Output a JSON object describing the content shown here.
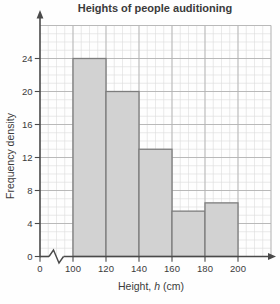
{
  "title": "Heights of people auditioning",
  "y_axis": {
    "label": "Frequency density",
    "ticks": [
      0,
      4,
      8,
      12,
      16,
      20,
      24
    ],
    "max": 28
  },
  "x_axis": {
    "label_prefix": "Height, ",
    "label_var": "h",
    "label_suffix": " (cm)",
    "label_full": "Height, h (cm)",
    "ticks": [
      0,
      100,
      120,
      140,
      160,
      180,
      200
    ],
    "has_break_between_0_and_100": true
  },
  "chart_data": {
    "type": "bar",
    "subtype": "histogram",
    "title": "Heights of people auditioning",
    "xlabel": "Height, h (cm)",
    "ylabel": "Frequency density",
    "categories": [
      "100-120",
      "120-140",
      "140-160",
      "160-180",
      "180-200"
    ],
    "values": [
      24,
      20,
      13,
      5.5,
      6.5
    ],
    "bins": [
      {
        "from": 100,
        "to": 120,
        "frequency_density": 24
      },
      {
        "from": 120,
        "to": 140,
        "frequency_density": 20
      },
      {
        "from": 140,
        "to": 160,
        "frequency_density": 13
      },
      {
        "from": 160,
        "to": 180,
        "frequency_density": 5.5
      },
      {
        "from": 180,
        "to": 200,
        "frequency_density": 6.5
      }
    ],
    "ylim": [
      0,
      28
    ],
    "x_tick_labels": [
      "0",
      "100",
      "120",
      "140",
      "160",
      "180",
      "200"
    ],
    "y_tick_labels": [
      "0",
      "4",
      "8",
      "12",
      "16",
      "20",
      "24"
    ],
    "grid": true,
    "x_axis_break": true,
    "legend": "none",
    "colors": {
      "bar_fill": "#d2d2d2",
      "bar_stroke": "#7d7d7d",
      "grid_minor": "#dcdcdc",
      "grid_major": "#b3b3b3",
      "axis": "#4a4a4a",
      "text": "#3b3b3b",
      "background": "#fefefe"
    }
  }
}
